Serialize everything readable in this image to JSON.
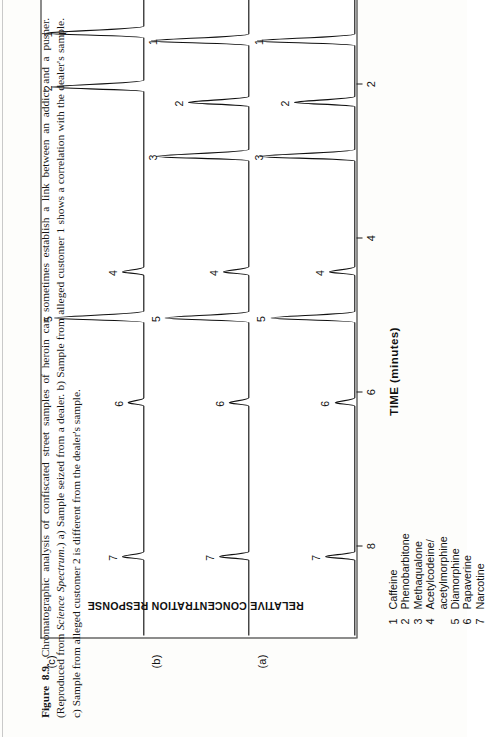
{
  "figure": {
    "number": "Figure 8.9.",
    "caption_rest": " Chromatographic analysis of confiscated street samples of heroin can sometimes establish a link between an addict and a pusher. (Reproduced from ",
    "caption_italic": "Science Spectrum",
    "caption_tail": ".) a) Sample seized from a dealer. b) Sample from alleged customer 1 shows a correlation with the dealer's sample. c) Sample from alleged customer 2 is different from the dealer's sample."
  },
  "axes": {
    "x_title": "TIME (minutes)",
    "y_title": "RELATIVE CONCENTRATION RESPONSE",
    "x_ticks": [
      "8",
      "6",
      "4",
      "2"
    ],
    "x_tick_values": [
      8,
      6,
      4,
      2
    ],
    "x_range_minutes": [
      9.2,
      0.6
    ],
    "direction": "decreasing left-to-right"
  },
  "panels": [
    {
      "id": "a",
      "label": "(a)",
      "title": "Sample seized from a dealer"
    },
    {
      "id": "b",
      "label": "(b)",
      "title": "Sample from alleged customer 1"
    },
    {
      "id": "c",
      "label": "(c)",
      "title": "Sample from alleged customer 2"
    }
  ],
  "legend": {
    "items": [
      {
        "num": "1",
        "name": "Caffeine"
      },
      {
        "num": "2",
        "name": "Phenobarbitone"
      },
      {
        "num": "3",
        "name": "Methaqualone"
      },
      {
        "num": "4",
        "name": "Acetylcodeine/\nacetylmorphine"
      },
      {
        "num": "5",
        "name": "Diamorphine"
      },
      {
        "num": "6",
        "name": "Papaverine"
      },
      {
        "num": "7",
        "name": "Narcotine"
      }
    ]
  },
  "chart_data": {
    "type": "line",
    "title": "Chromatographic analysis of confiscated street samples of heroin",
    "xlabel": "TIME (minutes)",
    "ylabel": "RELATIVE CONCENTRATION RESPONSE",
    "xlim": [
      9.2,
      0.6
    ],
    "grid": false,
    "legend_position": "below-left",
    "compounds": {
      "1": "Caffeine",
      "2": "Phenobarbitone",
      "3": "Methaqualone",
      "4": "Acetylcodeine/acetylmorphine",
      "5": "Diamorphine",
      "6": "Papaverine",
      "7": "Narcotine"
    },
    "series": [
      {
        "name": "(a) Sample seized from a dealer",
        "peaks": [
          {
            "label": "7",
            "compound": "Narcotine",
            "rt": 8.15,
            "height": 0.3
          },
          {
            "label": "6",
            "compound": "Papaverine",
            "rt": 6.15,
            "height": 0.2
          },
          {
            "label": "5",
            "compound": "Diamorphine",
            "rt": 5.05,
            "height": 0.86
          },
          {
            "label": "4",
            "compound": "Acetylcodeine/acetylmorphine",
            "rt": 4.45,
            "height": 0.26
          },
          {
            "label": "3",
            "compound": "Methaqualone",
            "rt": 2.95,
            "height": 0.97
          },
          {
            "label": "2",
            "compound": "Phenobarbitone",
            "rt": 2.25,
            "height": 0.62
          },
          {
            "label": "1",
            "compound": "Caffeine",
            "rt": 1.45,
            "height": 1.0
          }
        ]
      },
      {
        "name": "(b) Sample from alleged customer 1",
        "peaks": [
          {
            "label": "7",
            "compound": "Narcotine",
            "rt": 8.15,
            "height": 0.3
          },
          {
            "label": "6",
            "compound": "Papaverine",
            "rt": 6.15,
            "height": 0.2
          },
          {
            "label": "5",
            "compound": "Diamorphine",
            "rt": 5.05,
            "height": 0.86
          },
          {
            "label": "4",
            "compound": "Acetylcodeine/acetylmorphine",
            "rt": 4.45,
            "height": 0.26
          },
          {
            "label": "3",
            "compound": "Methaqualone",
            "rt": 2.95,
            "height": 0.95
          },
          {
            "label": "2",
            "compound": "Phenobarbitone",
            "rt": 2.25,
            "height": 0.62
          },
          {
            "label": "1",
            "compound": "Caffeine",
            "rt": 1.45,
            "height": 1.0
          }
        ]
      },
      {
        "name": "(c) Sample from alleged customer 2",
        "peaks": [
          {
            "label": "7",
            "compound": "Narcotine",
            "rt": 8.15,
            "height": 0.22
          },
          {
            "label": "6",
            "compound": "Papaverine",
            "rt": 6.15,
            "height": 0.16
          },
          {
            "label": "5",
            "compound": "Diamorphine",
            "rt": 5.05,
            "height": 0.92
          },
          {
            "label": "4",
            "compound": "Acetylcodeine/acetylmorphine",
            "rt": 4.45,
            "height": 0.22
          },
          {
            "label": "2",
            "compound": "Phenobarbitone",
            "rt": 2.05,
            "height": 0.95
          },
          {
            "label": "1",
            "compound": "Caffeine",
            "rt": 1.35,
            "height": 1.0
          }
        ]
      }
    ]
  }
}
